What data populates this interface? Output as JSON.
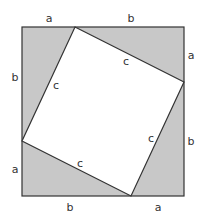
{
  "diagram": {
    "colors": {
      "shade": "#c8c8c8",
      "stroke": "#333333",
      "inner": "#ffffff"
    },
    "outer_labels": {
      "top": [
        "a",
        "b"
      ],
      "right": [
        "a",
        "b"
      ],
      "bottom": [
        "b",
        "a"
      ],
      "left": [
        "b",
        "a"
      ]
    },
    "inner_labels": [
      "c",
      "c",
      "c",
      "c"
    ]
  }
}
